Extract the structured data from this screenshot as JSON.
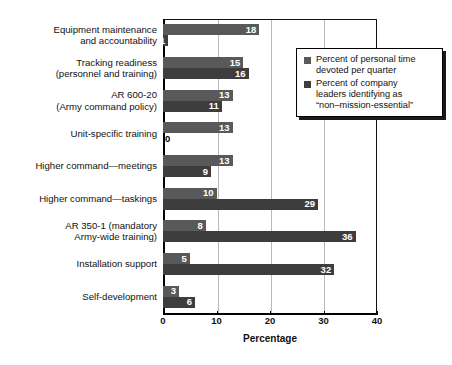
{
  "chart_data": {
    "type": "bar",
    "orientation": "horizontal",
    "title": "",
    "xlabel": "Percentage",
    "ylabel": "",
    "xlim": [
      0,
      40
    ],
    "xticks": [
      0,
      10,
      20,
      30,
      40
    ],
    "grid": "vertical",
    "legend_position": "top-right",
    "categories": [
      "Equipment maintenance\nand accountability",
      "Tracking readiness\n(personnel and training)",
      "AR 600-20\n(Army command policy)",
      "Unit-specific training",
      "Higher command—meetings",
      "Higher command—taskings",
      "AR 350-1 (mandatory\nArmy-wide training)",
      "Installation support",
      "Self-development"
    ],
    "series": [
      {
        "name": "Percent of personal time\ndevoted per quarter",
        "color": "#595959",
        "values": [
          18,
          15,
          13,
          13,
          13,
          10,
          8,
          5,
          3
        ]
      },
      {
        "name": "Percent of company\nleaders identifying as\n“non–mission-essential”",
        "color": "#3d3d3d",
        "values": [
          1,
          16,
          11,
          0,
          9,
          29,
          36,
          32,
          6
        ]
      }
    ]
  },
  "axis": {
    "xlabel": "Percentage",
    "tick_labels": [
      "0",
      "10",
      "20",
      "30",
      "40"
    ]
  },
  "legend": {
    "items": [
      {
        "label": "Percent of personal time\ndevoted per quarter",
        "color": "#595959"
      },
      {
        "label": "Percent of company\nleaders identifying as\n“non–mission-essential”",
        "color": "#3d3d3d"
      }
    ]
  }
}
